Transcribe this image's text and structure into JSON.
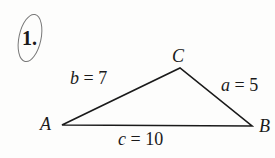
{
  "problem": {
    "number": "1."
  },
  "triangle": {
    "vertices": {
      "A": "A",
      "B": "B",
      "C": "C"
    },
    "sides": {
      "a": "a = 5",
      "b": "b = 7",
      "c": "c = 10"
    },
    "stroke_color": "#1a1a1a"
  }
}
